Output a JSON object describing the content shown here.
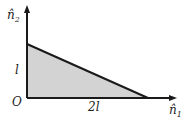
{
  "diagram": {
    "type": "region-plot",
    "axes": {
      "x_label": "n̂",
      "x_sub": "1",
      "y_label": "n̂",
      "y_sub": "2",
      "origin_label": "O"
    },
    "ticks": {
      "x_tick": "2l",
      "y_tick": "l"
    },
    "region": {
      "shape": "triangle",
      "vertices": [
        [
          0,
          0
        ],
        [
          2,
          0
        ],
        [
          0,
          1
        ]
      ],
      "fill": "#d3d3d3",
      "stroke": "#1a1a1a"
    }
  }
}
